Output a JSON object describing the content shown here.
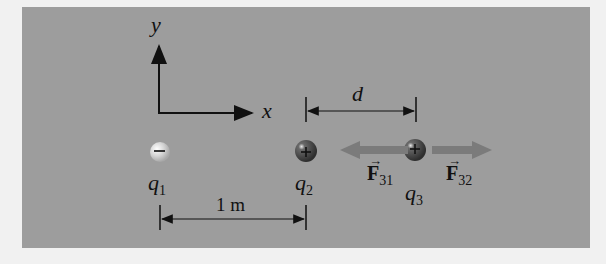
{
  "diagram": {
    "axes": {
      "y_label": "y",
      "x_label": "x"
    },
    "charges": [
      {
        "name": "q",
        "subscript": "1",
        "sign": "−",
        "x_m": 0
      },
      {
        "name": "q",
        "subscript": "2",
        "sign": "+",
        "x_m": 1
      },
      {
        "name": "q",
        "subscript": "3",
        "sign": "+",
        "x_m": "1 + d"
      }
    ],
    "dimensions": {
      "q1_q2": "1 m",
      "q2_q3": "d"
    },
    "forces": [
      {
        "symbol": "F",
        "vector_mark": "→",
        "subscript": "31",
        "direction": "left"
      },
      {
        "symbol": "F",
        "vector_mark": "→",
        "subscript": "32",
        "direction": "right"
      }
    ],
    "colors": {
      "panel": "#9d9d9d",
      "background": "#f1f1f1",
      "force_arrow": "#7b7b7b",
      "negative_charge": "#d6d6d6",
      "positive_charge": "#3e3e3e"
    }
  }
}
